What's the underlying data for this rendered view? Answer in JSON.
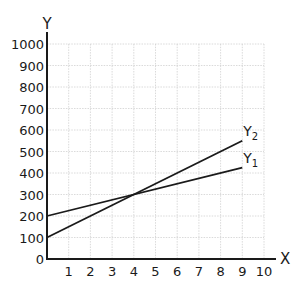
{
  "chart_data": {
    "type": "line",
    "title": "",
    "xlabel": "X",
    "ylabel": "Y",
    "xlim": [
      0,
      10
    ],
    "ylim": [
      0,
      1000
    ],
    "grid": true,
    "x_ticks": [
      1,
      2,
      3,
      4,
      5,
      6,
      7,
      8,
      9,
      10
    ],
    "y_ticks": [
      0,
      100,
      200,
      300,
      400,
      500,
      600,
      700,
      800,
      900,
      1000
    ],
    "series": [
      {
        "name": "Y1",
        "label_main": "Y",
        "label_sub": "1",
        "x": [
          0,
          9
        ],
        "values": [
          200,
          425
        ]
      },
      {
        "name": "Y2",
        "label_main": "Y",
        "label_sub": "2",
        "x": [
          0,
          9
        ],
        "values": [
          100,
          550
        ]
      }
    ],
    "legend": "inline-end-of-line"
  }
}
